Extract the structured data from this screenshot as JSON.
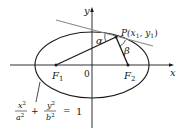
{
  "diagram": {
    "type": "ellipse-reflection-property",
    "axes": {
      "x_label": "x",
      "y_label": "y",
      "origin_label": "0"
    },
    "foci": [
      {
        "label": "F",
        "subscript": "1"
      },
      {
        "label": "F",
        "subscript": "2"
      }
    ],
    "point": {
      "label": "P(x",
      "sub1": "1",
      "mid": ", y",
      "sub2": "1",
      "end": ")"
    },
    "angles": {
      "alpha": "α",
      "beta": "β"
    },
    "equation": {
      "term1_num": "x",
      "term1_num_exp": "2",
      "term1_den": "a",
      "term1_den_exp": "2",
      "plus": "+",
      "term2_num": "y",
      "term2_num_exp": "2",
      "term2_den": "b",
      "term2_den_exp": "2",
      "equals": "=",
      "rhs": "1"
    },
    "colors": {
      "curve": "#1a1a1a",
      "tangent": "#8a8a8a",
      "axes": "#1a1a1a"
    }
  }
}
